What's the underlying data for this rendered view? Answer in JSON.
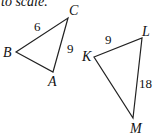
{
  "caption_fragment": "to scale.",
  "triangles": [
    {
      "name": "ABC",
      "vertices": {
        "A": "A",
        "B": "B",
        "C": "C"
      },
      "sides": {
        "BC": "6",
        "CA": "9"
      }
    },
    {
      "name": "KLM",
      "vertices": {
        "K": "K",
        "L": "L",
        "M": "M"
      },
      "sides": {
        "KL": "9",
        "LM": "18"
      }
    }
  ],
  "colors": {
    "stroke": "#222222"
  }
}
